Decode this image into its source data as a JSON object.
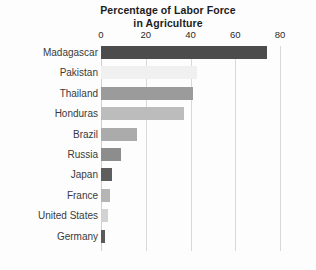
{
  "chart_data": {
    "type": "bar",
    "orientation": "horizontal",
    "title": "Percentage of Labor Force in Agriculture",
    "title_line1": "Percentage of Labor Force",
    "title_line2": "in Agriculture",
    "xlabel": "",
    "ylabel": "",
    "xlim": [
      0,
      80
    ],
    "xticks": [
      0,
      20,
      40,
      60,
      80
    ],
    "xtick_labels": [
      "0",
      "20",
      "40",
      "60",
      "80"
    ],
    "grid": "vertical",
    "legend": "none",
    "categories": [
      "Madagascar",
      "Pakistan",
      "Thailand",
      "Honduras",
      "Brazil",
      "Russia",
      "Japan",
      "France",
      "United States",
      "Germany"
    ],
    "values": [
      74,
      43,
      41,
      37,
      16,
      9,
      5,
      4,
      3,
      2
    ],
    "bar_colors": [
      "#4c4c4c",
      "#f0f0f0",
      "#9b9b9b",
      "#bcbcbc",
      "#ababab",
      "#8d8d8d",
      "#5e5e5e",
      "#b5b5b5",
      "#d2d2d2",
      "#5a5a5a"
    ],
    "bars": [
      {
        "label": "Madagascar",
        "value": 74,
        "color": "#4c4c4c"
      },
      {
        "label": "Pakistan",
        "value": 43,
        "color": "#f0f0f0"
      },
      {
        "label": "Thailand",
        "value": 41,
        "color": "#9b9b9b"
      },
      {
        "label": "Honduras",
        "value": 37,
        "color": "#bcbcbc"
      },
      {
        "label": "Brazil",
        "value": 16,
        "color": "#ababab"
      },
      {
        "label": "Russia",
        "value": 9,
        "color": "#8d8d8d"
      },
      {
        "label": "Japan",
        "value": 5,
        "color": "#5e5e5e"
      },
      {
        "label": "France",
        "value": 4,
        "color": "#b5b5b5"
      },
      {
        "label": "United States",
        "value": 3,
        "color": "#d2d2d2"
      },
      {
        "label": "Germany",
        "value": 2,
        "color": "#5a5a5a"
      }
    ]
  },
  "style": {
    "background": "#fdfdfd",
    "gridline_color": "#d9d9d9",
    "text_color": "#3a3a3a",
    "title_color": "#1c1c1c"
  }
}
